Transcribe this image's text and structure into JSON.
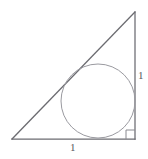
{
  "figure": {
    "kind": "geometry-diagram",
    "width": 148,
    "height": 159,
    "background_color": "#ffffff",
    "stroke_color_triangle": "#6b6b70",
    "stroke_color_circle": "#9a9aa0",
    "stroke_color_right_angle": "#8a8a90",
    "text_color": "#58585c"
  },
  "triangle": {
    "vertices": {
      "left": {
        "x": 12,
        "y": 139
      },
      "apex": {
        "x": 135,
        "y": 12
      },
      "right_angle": {
        "x": 135,
        "y": 139
      }
    },
    "sides": [
      {
        "name": "base",
        "from": "left",
        "to": "right_angle",
        "label": "1"
      },
      {
        "name": "height",
        "from": "right_angle",
        "to": "apex",
        "label": "1"
      },
      {
        "name": "hypotenuse",
        "from": "left",
        "to": "apex",
        "label": ""
      }
    ]
  },
  "circle": {
    "center": {
      "x": 98,
      "y": 101
    },
    "radius": 37,
    "tangent_to": [
      "base",
      "height",
      "hypotenuse"
    ]
  },
  "right_angle_marker": {
    "corner": {
      "x": 135,
      "y": 139
    },
    "size": 9
  },
  "labels": {
    "base_label": "1",
    "height_label": "1"
  }
}
